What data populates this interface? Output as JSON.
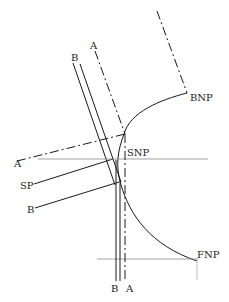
{
  "diagram": {
    "labels": {
      "bnp": "BNP",
      "snp": "SNP",
      "fnp": "FNP",
      "sp": "SP",
      "a_top": "A",
      "b_top": "B",
      "a_left": "A",
      "b_left": "B",
      "b_bottom": "B",
      "a_bottom": "A"
    },
    "colors": {
      "line": "#1a1a1a",
      "guide": "#8a8a8a",
      "background": "#ffffff"
    }
  }
}
